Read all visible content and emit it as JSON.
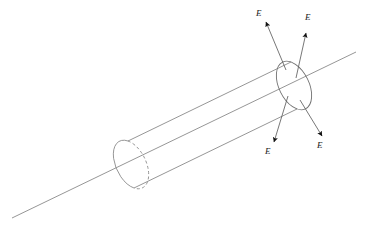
{
  "figure": {
    "background_color": "#ffffff",
    "line_color": "#8a8a8a",
    "arrow_color": "#1a1a1a",
    "label_color": "#1a1a1a"
  },
  "axis_line": {
    "name": "rod-axis-line",
    "x1": 12,
    "y1": 218,
    "x2": 356,
    "y2": 52,
    "style": "solid"
  },
  "cylinder": {
    "name": "charged-rod",
    "top_edge": {
      "x1": 128,
      "y1": 141,
      "x2": 291,
      "y2": 62
    },
    "bottom_edge": {
      "x1": 134,
      "y1": 188,
      "x2": 297,
      "y2": 109
    },
    "left_cap": {
      "cx": 131,
      "cy": 164.5,
      "rx": 15,
      "ry": 26,
      "rotation": -26,
      "front_style": "solid",
      "back_style": "dashed"
    },
    "right_cap": {
      "cx": 294,
      "cy": 85.5,
      "rx": 15,
      "ry": 26,
      "rotation": -26,
      "style": "solid"
    }
  },
  "field_arrows": [
    {
      "name": "field-arrow-upper-left",
      "label": "E",
      "x1": 286,
      "y1": 70,
      "x2": 266,
      "y2": 22,
      "label_x": 256,
      "label_y": 9
    },
    {
      "name": "field-arrow-upper-right",
      "label": "E",
      "x1": 296,
      "y1": 78,
      "x2": 306,
      "y2": 33,
      "label_x": 305,
      "label_y": 13
    },
    {
      "name": "field-arrow-lower-left",
      "label": "E",
      "x1": 288,
      "y1": 96,
      "x2": 274,
      "y2": 142,
      "label_x": 265,
      "label_y": 147
    },
    {
      "name": "field-arrow-lower-right",
      "label": "E",
      "x1": 300,
      "y1": 100,
      "x2": 322,
      "y2": 136,
      "label_x": 317,
      "label_y": 141
    }
  ]
}
